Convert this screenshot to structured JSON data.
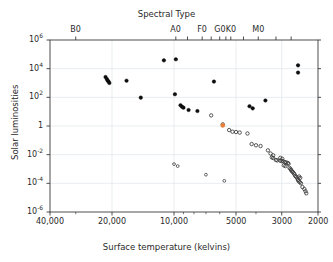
{
  "chart_data": {
    "type": "scatter",
    "title": "Spectral Type",
    "xlabel": "Surface temperature (kelvins)",
    "ylabel": "Solar luminosities",
    "xscale": "log",
    "yscale": "log",
    "x_reversed": true,
    "xlim": [
      40000,
      2000
    ],
    "ylim": [
      1e-06,
      1000000.0
    ],
    "grid": true,
    "legend": "none",
    "x_ticks": [
      {
        "value": 40000,
        "label": "40,000"
      },
      {
        "value": 20000,
        "label": "20,000"
      },
      {
        "value": 10000,
        "label": "10,000"
      },
      {
        "value": 5000,
        "label": "5000"
      },
      {
        "value": 3000,
        "label": "3000"
      },
      {
        "value": 2000,
        "label": "2000"
      }
    ],
    "y_ticks": [
      {
        "value": 1000000,
        "label": "10",
        "exp": "6"
      },
      {
        "value": 10000,
        "label": "10",
        "exp": "4"
      },
      {
        "value": 100,
        "label": "10",
        "exp": "2"
      },
      {
        "value": 1,
        "label": "1",
        "exp": ""
      },
      {
        "value": 0.01,
        "label": "10",
        "exp": "-2"
      },
      {
        "value": 0.0001,
        "label": "10",
        "exp": "-4"
      },
      {
        "value": 1e-06,
        "label": "10",
        "exp": "-6"
      }
    ],
    "top_axis_title": "Spectral Type",
    "spectral_types": [
      {
        "label": "B0",
        "temperature": 30000
      },
      {
        "label": "A0",
        "temperature": 9800
      },
      {
        "label": "F0",
        "temperature": 7300
      },
      {
        "label": "G0",
        "temperature": 6000
      },
      {
        "label": "K0",
        "temperature": 5300
      },
      {
        "label": "M0",
        "temperature": 3900
      }
    ],
    "spectral_tick_temperatures": [
      30000,
      9800,
      8600,
      7300,
      6600,
      6000,
      5600,
      5300,
      4600,
      3900,
      3200,
      2700
    ],
    "series": [
      {
        "name": "bright-stars-filled",
        "marker": "filled-circle",
        "color": "#0d0d0d",
        "size": 3.6,
        "points": [
          {
            "t": 21500,
            "l": 2600
          },
          {
            "t": 21200,
            "l": 1900
          },
          {
            "t": 21000,
            "l": 1500
          },
          {
            "t": 20800,
            "l": 1250
          },
          {
            "t": 20600,
            "l": 1000
          },
          {
            "t": 17000,
            "l": 1450
          },
          {
            "t": 14500,
            "l": 95
          },
          {
            "t": 11200,
            "l": 38000
          },
          {
            "t": 9800,
            "l": 45000
          },
          {
            "t": 9900,
            "l": 165
          },
          {
            "t": 9300,
            "l": 28
          },
          {
            "t": 9150,
            "l": 22
          },
          {
            "t": 9000,
            "l": 19
          },
          {
            "t": 8500,
            "l": 13
          },
          {
            "t": 7700,
            "l": 11
          },
          {
            "t": 6400,
            "l": 1250
          },
          {
            "t": 4300,
            "l": 24
          },
          {
            "t": 4150,
            "l": 17
          },
          {
            "t": 3600,
            "l": 60
          },
          {
            "t": 2500,
            "l": 17000
          },
          {
            "t": 2500,
            "l": 5300
          }
        ]
      },
      {
        "name": "main-sequence-open",
        "marker": "open-circle",
        "color": "#3b3b3b",
        "size": 3.4,
        "points": [
          {
            "t": 6600,
            "l": 5.5
          },
          {
            "t": 5800,
            "l": 1.3
          },
          {
            "t": 5400,
            "l": 0.52
          },
          {
            "t": 5200,
            "l": 0.4
          },
          {
            "t": 5000,
            "l": 0.38
          },
          {
            "t": 4800,
            "l": 0.35
          },
          {
            "t": 4400,
            "l": 0.3
          },
          {
            "t": 4200,
            "l": 0.055
          },
          {
            "t": 4000,
            "l": 0.045
          },
          {
            "t": 3800,
            "l": 0.04
          },
          {
            "t": 3500,
            "l": 0.02
          },
          {
            "t": 3400,
            "l": 0.012
          },
          {
            "t": 3300,
            "l": 0.009
          },
          {
            "t": 3200,
            "l": 0.0042
          },
          {
            "t": 3150,
            "l": 0.004
          },
          {
            "t": 3050,
            "l": 0.0038
          },
          {
            "t": 3000,
            "l": 0.0036
          },
          {
            "t": 2950,
            "l": 0.0034
          },
          {
            "t": 2900,
            "l": 0.003
          },
          {
            "t": 2850,
            "l": 0.0029
          },
          {
            "t": 2800,
            "l": 0.0026
          },
          {
            "t": 2780,
            "l": 0.0023
          },
          {
            "t": 2750,
            "l": 0.0012
          },
          {
            "t": 2720,
            "l": 0.001
          },
          {
            "t": 2700,
            "l": 0.00085
          },
          {
            "t": 2680,
            "l": 0.0007
          },
          {
            "t": 2650,
            "l": 0.00062
          },
          {
            "t": 2620,
            "l": 0.0005
          },
          {
            "t": 2600,
            "l": 0.00042
          },
          {
            "t": 2580,
            "l": 0.00033
          },
          {
            "t": 2550,
            "l": 0.00028
          },
          {
            "t": 2520,
            "l": 0.00022
          },
          {
            "t": 2500,
            "l": 0.00017
          },
          {
            "t": 2480,
            "l": 0.00014
          },
          {
            "t": 2450,
            "l": 0.00012
          },
          {
            "t": 2420,
            "l": 0.0001
          },
          {
            "t": 2380,
            "l": 5.5e-05
          },
          {
            "t": 2330,
            "l": 4e-05
          },
          {
            "t": 2300,
            "l": 2.8e-05
          },
          {
            "t": 2280,
            "l": 2e-05
          },
          {
            "t": 3050,
            "l": 0.006
          },
          {
            "t": 2980,
            "l": 0.0052
          },
          {
            "t": 2930,
            "l": 0.0018
          },
          {
            "t": 2880,
            "l": 0.0016
          },
          {
            "t": 3350,
            "l": 0.0065
          },
          {
            "t": 3300,
            "l": 0.0058
          },
          {
            "t": 2470,
            "l": 0.0003
          },
          {
            "t": 2440,
            "l": 0.00024
          }
        ]
      },
      {
        "name": "white-dwarfs",
        "marker": "open-circle",
        "color": "#4a4a4a",
        "size": 2.8,
        "points": [
          {
            "t": 10000,
            "l": 0.0022
          },
          {
            "t": 9600,
            "l": 0.0016
          },
          {
            "t": 7000,
            "l": 0.0004
          },
          {
            "t": 5700,
            "l": 0.00015
          }
        ]
      },
      {
        "name": "sun-highlight",
        "marker": "filled-circle",
        "color": "#e8803a",
        "size": 4.2,
        "points": [
          {
            "t": 5800,
            "l": 1.1
          }
        ]
      }
    ]
  },
  "axes": {
    "frame_color": "#3a3a3a",
    "grid_color": "#dfe6ea"
  }
}
